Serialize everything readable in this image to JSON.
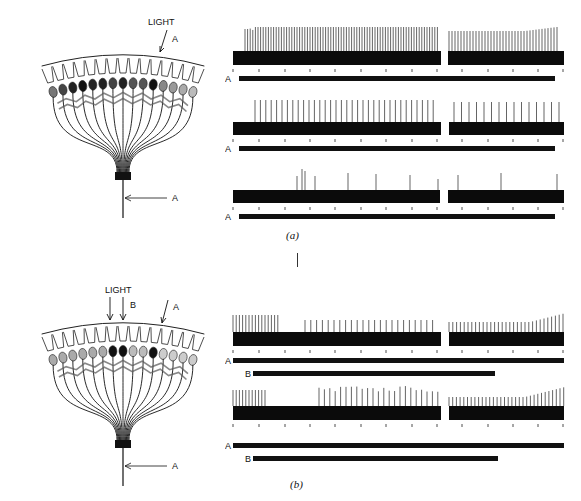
{
  "figure": {
    "panels": [
      {
        "id": "a",
        "caption": "(a)",
        "diagram": {
          "light_label": "LIGHT",
          "stimulus_labels": [
            "A"
          ],
          "recording_label": "A",
          "receptor_count": 15,
          "receptor_shading": [
            "#777",
            "#444",
            "#222",
            "#111",
            "#222",
            "#222",
            "#444",
            "#222",
            "#555",
            "#555",
            "#111",
            "#888",
            "#999",
            "#aaa",
            "#bbb"
          ]
        },
        "traces": [
          {
            "stim_bars": [
              {
                "label": "A"
              }
            ],
            "spike_pattern": "dense-high"
          },
          {
            "stim_bars": [
              {
                "label": "A"
              }
            ],
            "spike_pattern": "medium"
          },
          {
            "stim_bars": [
              {
                "label": "A"
              }
            ],
            "spike_pattern": "sparse"
          }
        ]
      },
      {
        "id": "b",
        "caption": "(b)",
        "diagram": {
          "light_label": "LIGHT",
          "stimulus_labels": [
            "B",
            "A"
          ],
          "recording_label": "A",
          "receptor_count": 15,
          "receptor_shading": [
            "#aaa",
            "#aaa",
            "#aaa",
            "#aaa",
            "#aaa",
            "#aaa",
            "#111",
            "#111",
            "#bbb",
            "#bbb",
            "#111",
            "#ccc",
            "#ccc",
            "#ccc",
            "#ccc"
          ]
        },
        "traces": [
          {
            "stim_bars": [
              {
                "label": "A"
              },
              {
                "label": "B"
              }
            ],
            "spike_pattern": "inhibited-first"
          },
          {
            "stim_bars": [
              {
                "label": "A"
              },
              {
                "label": "B"
              }
            ],
            "spike_pattern": "inhibited-second"
          }
        ]
      }
    ],
    "colors": {
      "ink": "#111111",
      "background": "#ffffff"
    }
  }
}
